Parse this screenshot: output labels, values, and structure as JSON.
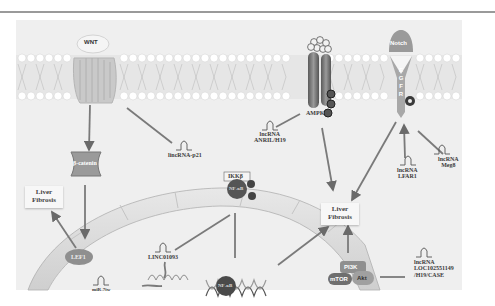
{
  "diagram": {
    "type": "signaling-pathway",
    "theme": "grayscale",
    "receptors": {
      "wnt": "WNT",
      "ampk": "AMPK",
      "notch": "Notch",
      "egfr": "E G F R"
    },
    "proteins": {
      "beta_catenin": "β-catenin",
      "lef1": "LEF1",
      "ikkb": "IKKβ",
      "nfkb_cyto": "NF-κB",
      "nfkb_nuc": "NF-κB",
      "pi3k": "PI3K",
      "mtor": "mTOR",
      "akt": "Akt"
    },
    "phospho_marker": "P",
    "lncrnas": {
      "p21": "lincRNA-p21",
      "anril": [
        "lncRNA",
        "ANRIL/H19"
      ],
      "lfar1": [
        "lncRNA",
        "LFAR1"
      ],
      "meg8": [
        "lncRNA",
        "Meg8"
      ],
      "linc01093": "LINC01093",
      "mir": "miR-7iw",
      "loc": [
        "lncRNA",
        "LOC102551149",
        "/H19/CASE"
      ]
    },
    "outcomes": {
      "left": [
        "Liver",
        "Fibrosis"
      ],
      "center": [
        "Liver",
        "Fibrosis"
      ]
    },
    "colors": {
      "background": "#efefef",
      "membrane_head": "#ffffff",
      "protein_dark": "#6e6e6e",
      "arrow": "#7a7a7a",
      "nucleus": "#d9d9d9"
    }
  }
}
